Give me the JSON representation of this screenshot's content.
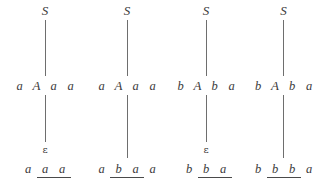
{
  "figure": {
    "title": "",
    "kind": "parse-derivation-steps",
    "line_color": "#6e6e6e",
    "text_color": "#3a3a3a",
    "underline_color": "#4a4a4a",
    "epsilon_glyph": "ε",
    "columns": [
      {
        "id": "step-1",
        "left_px": 6,
        "width_px": 78,
        "root": "S",
        "root_offset_px": 0,
        "middle": {
          "symbols": [
            "a",
            "A",
            "a",
            "a"
          ],
          "marked": [
            false,
            false,
            false,
            false
          ],
          "nonterminal_index": 1
        },
        "epsilon_label": "ε",
        "has_epsilon": true,
        "bottom": {
          "symbols": [
            "a",
            "a",
            "a"
          ],
          "marked": [
            false,
            true,
            true
          ]
        },
        "upper_link": {
          "top_px": 20,
          "height_px": 56
        },
        "lower_link": {
          "top_px": 95,
          "height_px": 47
        }
      },
      {
        "id": "step-2",
        "left_px": 86,
        "width_px": 82,
        "root": "S",
        "root_offset_px": 0,
        "middle": {
          "symbols": [
            "a",
            "A",
            "a",
            "a"
          ],
          "marked": [
            false,
            false,
            false,
            false
          ],
          "nonterminal_index": 1
        },
        "epsilon_label": "",
        "has_epsilon": false,
        "bottom": {
          "symbols": [
            "a",
            "b",
            "a",
            "a"
          ],
          "marked": [
            false,
            true,
            true,
            false
          ]
        },
        "upper_link": {
          "top_px": 20,
          "height_px": 56
        },
        "lower_link": {
          "top_px": 95,
          "height_px": 63
        }
      },
      {
        "id": "step-3",
        "left_px": 166,
        "width_px": 80,
        "root": "S",
        "root_offset_px": 0,
        "middle": {
          "symbols": [
            "b",
            "A",
            "b",
            "a"
          ],
          "marked": [
            false,
            false,
            false,
            false
          ],
          "nonterminal_index": 1
        },
        "epsilon_label": "ε",
        "has_epsilon": true,
        "bottom": {
          "symbols": [
            "b",
            "b",
            "a"
          ],
          "marked": [
            false,
            true,
            true
          ]
        },
        "upper_link": {
          "top_px": 20,
          "height_px": 56
        },
        "lower_link": {
          "top_px": 95,
          "height_px": 47
        }
      },
      {
        "id": "step-4",
        "left_px": 244,
        "width_px": 79,
        "root": "S",
        "root_offset_px": 0,
        "middle": {
          "symbols": [
            "b",
            "A",
            "b",
            "a"
          ],
          "marked": [
            false,
            false,
            false,
            false
          ],
          "nonterminal_index": 1
        },
        "epsilon_label": "",
        "has_epsilon": false,
        "bottom": {
          "symbols": [
            "b",
            "b",
            "b",
            "a"
          ],
          "marked": [
            false,
            true,
            true,
            false
          ]
        },
        "upper_link": {
          "top_px": 20,
          "height_px": 56
        },
        "lower_link": {
          "top_px": 95,
          "height_px": 63
        }
      }
    ]
  }
}
